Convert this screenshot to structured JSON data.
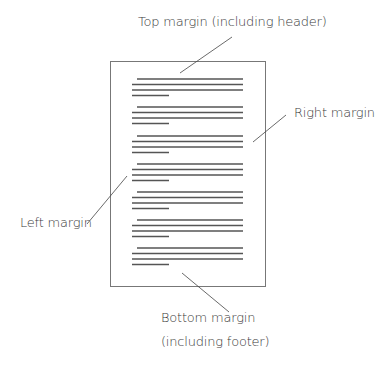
{
  "labels": {
    "top": "Top margin (including header)",
    "right": "Right margin",
    "left": "Left margin",
    "bottom_line1": "Bottom margin",
    "bottom_line2": "(including footer)"
  },
  "page": {
    "x": 110,
    "y": 61,
    "w": 155,
    "h": 225,
    "border": "#777777"
  },
  "text_lines": {
    "color": "#555555",
    "paragraph_tops": [
      79,
      107,
      136,
      164,
      192,
      220,
      248
    ],
    "line_gap": 5.5,
    "indent_x": 137,
    "left_x": 132,
    "right_x": 243,
    "short_end_x": 169
  },
  "leaders": [
    {
      "name": "top",
      "x1": 232,
      "y1": 37,
      "x2": 180,
      "y2": 73
    },
    {
      "name": "right",
      "x1": 286,
      "y1": 115,
      "x2": 253,
      "y2": 142
    },
    {
      "name": "left",
      "x1": 87,
      "y1": 224,
      "x2": 127,
      "y2": 176
    },
    {
      "name": "bottom",
      "x1": 182,
      "y1": 273,
      "x2": 229,
      "y2": 312
    }
  ]
}
